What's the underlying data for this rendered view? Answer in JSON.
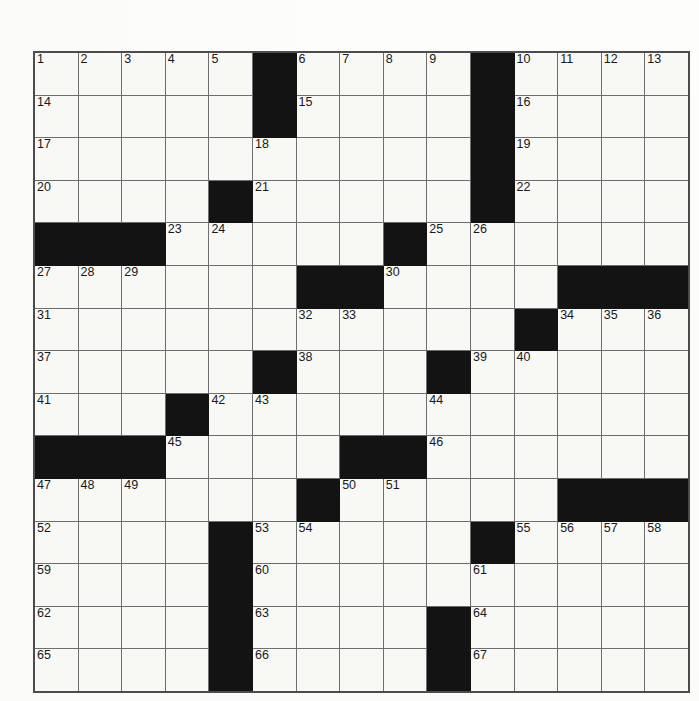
{
  "page": {
    "top_strip_text": "",
    "top_strip_text_right": ""
  },
  "puzzle": {
    "title": "",
    "rows": 15,
    "cols": 15,
    "colors": {
      "block": "#131313",
      "cell": "#f8f8f5",
      "grid_line": "#6e6e70",
      "border": "#4c4c4e",
      "number": "#18181a"
    },
    "grid": [
      [
        {
          "t": "n",
          "n": "1"
        },
        {
          "t": "n",
          "n": "2"
        },
        {
          "t": "n",
          "n": "3"
        },
        {
          "t": "n",
          "n": "4"
        },
        {
          "t": "n",
          "n": "5"
        },
        {
          "t": "b"
        },
        {
          "t": "n",
          "n": "6"
        },
        {
          "t": "n",
          "n": "7"
        },
        {
          "t": "n",
          "n": "8"
        },
        {
          "t": "n",
          "n": "9"
        },
        {
          "t": "b"
        },
        {
          "t": "n",
          "n": "10"
        },
        {
          "t": "n",
          "n": "11"
        },
        {
          "t": "n",
          "n": "12"
        },
        {
          "t": "n",
          "n": "13"
        }
      ],
      [
        {
          "t": "n",
          "n": "14"
        },
        {
          "t": "e"
        },
        {
          "t": "e"
        },
        {
          "t": "e"
        },
        {
          "t": "e"
        },
        {
          "t": "b"
        },
        {
          "t": "n",
          "n": "15"
        },
        {
          "t": "e"
        },
        {
          "t": "e"
        },
        {
          "t": "e"
        },
        {
          "t": "b"
        },
        {
          "t": "n",
          "n": "16"
        },
        {
          "t": "e"
        },
        {
          "t": "e"
        },
        {
          "t": "e"
        }
      ],
      [
        {
          "t": "n",
          "n": "17"
        },
        {
          "t": "e"
        },
        {
          "t": "e"
        },
        {
          "t": "e"
        },
        {
          "t": "e"
        },
        {
          "t": "n",
          "n": "18"
        },
        {
          "t": "e"
        },
        {
          "t": "e"
        },
        {
          "t": "e"
        },
        {
          "t": "e"
        },
        {
          "t": "b"
        },
        {
          "t": "n",
          "n": "19"
        },
        {
          "t": "e"
        },
        {
          "t": "e"
        },
        {
          "t": "e"
        }
      ],
      [
        {
          "t": "n",
          "n": "20"
        },
        {
          "t": "e"
        },
        {
          "t": "e"
        },
        {
          "t": "e"
        },
        {
          "t": "b"
        },
        {
          "t": "n",
          "n": "21"
        },
        {
          "t": "e"
        },
        {
          "t": "e"
        },
        {
          "t": "e"
        },
        {
          "t": "e"
        },
        {
          "t": "b"
        },
        {
          "t": "n",
          "n": "22"
        },
        {
          "t": "e"
        },
        {
          "t": "e"
        },
        {
          "t": "e"
        }
      ],
      [
        {
          "t": "b"
        },
        {
          "t": "b"
        },
        {
          "t": "b"
        },
        {
          "t": "n",
          "n": "23"
        },
        {
          "t": "n",
          "n": "24"
        },
        {
          "t": "e"
        },
        {
          "t": "e"
        },
        {
          "t": "e"
        },
        {
          "t": "b"
        },
        {
          "t": "n",
          "n": "25"
        },
        {
          "t": "n",
          "n": "26"
        },
        {
          "t": "e"
        },
        {
          "t": "e"
        },
        {
          "t": "e"
        },
        {
          "t": "e"
        }
      ],
      [
        {
          "t": "n",
          "n": "27"
        },
        {
          "t": "n",
          "n": "28"
        },
        {
          "t": "n",
          "n": "29"
        },
        {
          "t": "e"
        },
        {
          "t": "e"
        },
        {
          "t": "e"
        },
        {
          "t": "b"
        },
        {
          "t": "b"
        },
        {
          "t": "n",
          "n": "30"
        },
        {
          "t": "e"
        },
        {
          "t": "e"
        },
        {
          "t": "e"
        },
        {
          "t": "b"
        },
        {
          "t": "b"
        },
        {
          "t": "b"
        }
      ],
      [
        {
          "t": "n",
          "n": "31"
        },
        {
          "t": "e"
        },
        {
          "t": "e"
        },
        {
          "t": "e"
        },
        {
          "t": "e"
        },
        {
          "t": "e"
        },
        {
          "t": "n",
          "n": "32"
        },
        {
          "t": "n",
          "n": "33"
        },
        {
          "t": "e"
        },
        {
          "t": "e"
        },
        {
          "t": "e"
        },
        {
          "t": "b"
        },
        {
          "t": "n",
          "n": "34"
        },
        {
          "t": "n",
          "n": "35"
        },
        {
          "t": "n",
          "n": "36"
        }
      ],
      [
        {
          "t": "n",
          "n": "37"
        },
        {
          "t": "e"
        },
        {
          "t": "e"
        },
        {
          "t": "e"
        },
        {
          "t": "e"
        },
        {
          "t": "b"
        },
        {
          "t": "n",
          "n": "38"
        },
        {
          "t": "e"
        },
        {
          "t": "e"
        },
        {
          "t": "b"
        },
        {
          "t": "n",
          "n": "39"
        },
        {
          "t": "n",
          "n": "40"
        },
        {
          "t": "e"
        },
        {
          "t": "e"
        },
        {
          "t": "e"
        }
      ],
      [
        {
          "t": "n",
          "n": "41"
        },
        {
          "t": "e"
        },
        {
          "t": "e"
        },
        {
          "t": "b"
        },
        {
          "t": "n",
          "n": "42"
        },
        {
          "t": "n",
          "n": "43"
        },
        {
          "t": "e"
        },
        {
          "t": "e"
        },
        {
          "t": "e"
        },
        {
          "t": "n",
          "n": "44"
        },
        {
          "t": "e"
        },
        {
          "t": "e"
        },
        {
          "t": "e"
        },
        {
          "t": "e"
        },
        {
          "t": "e"
        }
      ],
      [
        {
          "t": "b"
        },
        {
          "t": "b"
        },
        {
          "t": "b"
        },
        {
          "t": "n",
          "n": "45"
        },
        {
          "t": "e"
        },
        {
          "t": "e"
        },
        {
          "t": "e"
        },
        {
          "t": "b"
        },
        {
          "t": "b"
        },
        {
          "t": "n",
          "n": "46"
        },
        {
          "t": "e"
        },
        {
          "t": "e"
        },
        {
          "t": "e"
        },
        {
          "t": "e"
        },
        {
          "t": "e"
        }
      ],
      [
        {
          "t": "n",
          "n": "47"
        },
        {
          "t": "n",
          "n": "48"
        },
        {
          "t": "n",
          "n": "49"
        },
        {
          "t": "e"
        },
        {
          "t": "e"
        },
        {
          "t": "e"
        },
        {
          "t": "b"
        },
        {
          "t": "n",
          "n": "50"
        },
        {
          "t": "n",
          "n": "51"
        },
        {
          "t": "e"
        },
        {
          "t": "e"
        },
        {
          "t": "e"
        },
        {
          "t": "b"
        },
        {
          "t": "b"
        },
        {
          "t": "b"
        }
      ],
      [
        {
          "t": "n",
          "n": "52"
        },
        {
          "t": "e"
        },
        {
          "t": "e"
        },
        {
          "t": "e"
        },
        {
          "t": "b"
        },
        {
          "t": "n",
          "n": "53"
        },
        {
          "t": "n",
          "n": "54"
        },
        {
          "t": "e"
        },
        {
          "t": "e"
        },
        {
          "t": "e"
        },
        {
          "t": "b"
        },
        {
          "t": "n",
          "n": "55"
        },
        {
          "t": "n",
          "n": "56"
        },
        {
          "t": "n",
          "n": "57"
        },
        {
          "t": "n",
          "n": "58"
        }
      ],
      [
        {
          "t": "n",
          "n": "59"
        },
        {
          "t": "e"
        },
        {
          "t": "e"
        },
        {
          "t": "e"
        },
        {
          "t": "b"
        },
        {
          "t": "n",
          "n": "60"
        },
        {
          "t": "e"
        },
        {
          "t": "e"
        },
        {
          "t": "e"
        },
        {
          "t": "e"
        },
        {
          "t": "n",
          "n": "61"
        },
        {
          "t": "e"
        },
        {
          "t": "e"
        },
        {
          "t": "e"
        },
        {
          "t": "e"
        }
      ],
      [
        {
          "t": "n",
          "n": "62"
        },
        {
          "t": "e"
        },
        {
          "t": "e"
        },
        {
          "t": "e"
        },
        {
          "t": "b"
        },
        {
          "t": "n",
          "n": "63"
        },
        {
          "t": "e"
        },
        {
          "t": "e"
        },
        {
          "t": "e"
        },
        {
          "t": "b"
        },
        {
          "t": "n",
          "n": "64"
        },
        {
          "t": "e"
        },
        {
          "t": "e"
        },
        {
          "t": "e"
        },
        {
          "t": "e"
        }
      ],
      [
        {
          "t": "n",
          "n": "65"
        },
        {
          "t": "e"
        },
        {
          "t": "e"
        },
        {
          "t": "e"
        },
        {
          "t": "b"
        },
        {
          "t": "n",
          "n": "66"
        },
        {
          "t": "e"
        },
        {
          "t": "e"
        },
        {
          "t": "e"
        },
        {
          "t": "b"
        },
        {
          "t": "n",
          "n": "67"
        },
        {
          "t": "e"
        },
        {
          "t": "e"
        },
        {
          "t": "e"
        },
        {
          "t": "e"
        }
      ]
    ]
  }
}
